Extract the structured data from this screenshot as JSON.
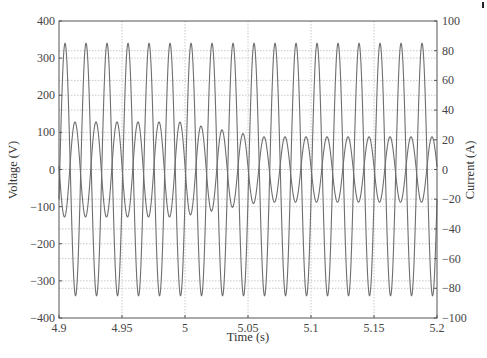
{
  "chart_data": {
    "type": "line",
    "title": "",
    "xlabel": "Time (s)",
    "ylabel": "Voltage (V)",
    "y2label": "Current (A)",
    "xlim": [
      4.9,
      5.2
    ],
    "ylim": [
      -400,
      400
    ],
    "y2lim": [
      -100,
      100
    ],
    "x_ticks": [
      "4.9",
      "4.95",
      "5",
      "5.05",
      "5.1",
      "5.15",
      "5.2"
    ],
    "x_tick_values": [
      4.9,
      4.95,
      5.0,
      5.05,
      5.1,
      5.15,
      5.2
    ],
    "y_ticks": [
      "400",
      "300",
      "200",
      "100",
      "0",
      "-100",
      "-200",
      "-300",
      "-400"
    ],
    "y_tick_values": [
      400,
      300,
      200,
      100,
      0,
      -100,
      -200,
      -300,
      -400
    ],
    "y2_ticks": [
      "100",
      "80",
      "60",
      "40",
      "20",
      "0",
      "-20",
      "-40",
      "-60",
      "-80",
      "-100"
    ],
    "y2_tick_values": [
      100,
      80,
      60,
      40,
      20,
      0,
      -20,
      -40,
      -60,
      -80,
      -100
    ],
    "grid": true,
    "legend": null,
    "series": [
      {
        "name": "Voltage",
        "axis": "left",
        "unit": "V",
        "frequency_hz": 60,
        "amplitude": 340,
        "first_peak_time": 4.9048,
        "cycles_shown": 18
      },
      {
        "name": "Current",
        "axis": "right",
        "unit": "A",
        "frequency_hz": 60,
        "amplitude_start": 32,
        "amplitude_end": 22,
        "amplitude_transition": [
          4.995,
          5.06
        ],
        "first_peak_time": 4.9127,
        "cycles_shown": 18
      }
    ],
    "annotations": []
  },
  "colors": {
    "line": "#6e6e6e",
    "frame": "#555555",
    "grid": "#c8c8c8"
  }
}
